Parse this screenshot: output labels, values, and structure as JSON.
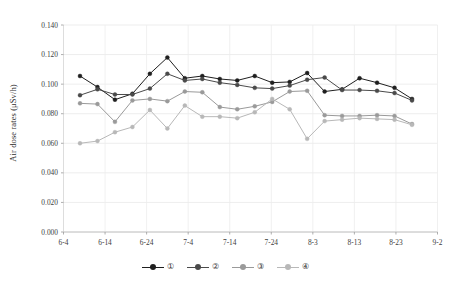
{
  "chart_data": {
    "type": "line",
    "title": "",
    "subtitle": "",
    "xlabel": "",
    "ylabel": "Air dose rates (μSv/h)",
    "ylim": [
      0.0,
      0.14
    ],
    "yticks": [
      "0.000",
      "0.020",
      "0.040",
      "0.060",
      "0.080",
      "0.100",
      "0.120",
      "0.140"
    ],
    "ytick_values": [
      0.0,
      0.02,
      0.04,
      0.06,
      0.08,
      0.1,
      0.12,
      0.14
    ],
    "xticks": [
      "6-4",
      "6-14",
      "6-24",
      "7-4",
      "7-14",
      "7-24",
      "8-3",
      "8-13",
      "8-23",
      "9-2"
    ],
    "xlim_labels": [
      "6-4",
      "9-2"
    ],
    "grid": "both-light",
    "legend_position": "bottom-center",
    "x": [
      "6-9",
      "6-16",
      "6-23",
      "6-26",
      "6-29",
      "7-2",
      "7-5",
      "7-8",
      "7-11",
      "7-14",
      "7-17",
      "7-20",
      "7-23",
      "7-26",
      "7-29",
      "8-1",
      "8-5",
      "8-9",
      "8-13",
      "8-29"
    ],
    "series": [
      {
        "name": "①",
        "label": "①",
        "color": "#1f1f1f",
        "values": [
          0.1055,
          0.098,
          0.0895,
          0.0935,
          0.107,
          0.118,
          0.104,
          0.1055,
          0.1035,
          0.1025,
          0.1055,
          0.101,
          0.1015,
          0.1075,
          0.095,
          0.0965,
          0.104,
          0.101,
          0.0975,
          0.09
        ]
      },
      {
        "name": "②",
        "label": "②",
        "color": "#4a4a4a",
        "values": [
          0.0925,
          0.0965,
          0.093,
          0.093,
          0.097,
          0.107,
          0.1025,
          0.1035,
          0.101,
          0.0995,
          0.0975,
          0.097,
          0.099,
          0.103,
          0.1045,
          0.096,
          0.096,
          0.0955,
          0.094,
          0.089
        ]
      },
      {
        "name": "③",
        "label": "③",
        "color": "#9a9a9a",
        "values": [
          0.087,
          0.0865,
          0.0745,
          0.089,
          0.09,
          0.0885,
          0.095,
          0.0945,
          0.0845,
          0.083,
          0.085,
          0.088,
          0.095,
          0.0955,
          0.079,
          0.0785,
          0.0785,
          0.079,
          0.0785,
          0.073
        ]
      },
      {
        "name": "④",
        "label": "④",
        "color": "#b8b8b8",
        "values": [
          0.06,
          0.0615,
          0.0675,
          0.071,
          0.0825,
          0.07,
          0.0855,
          0.078,
          0.078,
          0.077,
          0.081,
          0.09,
          0.083,
          0.063,
          0.075,
          0.076,
          0.077,
          0.0765,
          0.076,
          0.0725
        ]
      }
    ]
  },
  "legend": {
    "items": [
      {
        "label": "①",
        "color": "#1f1f1f"
      },
      {
        "label": "②",
        "color": "#4a4a4a"
      },
      {
        "label": "③",
        "color": "#9a9a9a"
      },
      {
        "label": "④",
        "color": "#b8b8b8"
      }
    ]
  }
}
